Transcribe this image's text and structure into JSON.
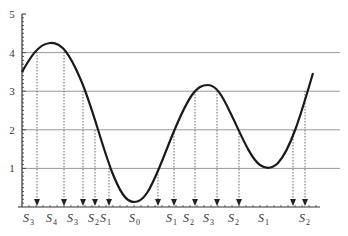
{
  "diagram": {
    "type": "curve-quantization",
    "y_axis": {
      "min": 0,
      "max": 5,
      "tick_labels": [
        "1",
        "2",
        "3",
        "4",
        "5"
      ],
      "gridlines_at": [
        1,
        2,
        3,
        4
      ]
    },
    "x_axis_labels": [
      {
        "base": "S",
        "sub": "3"
      },
      {
        "base": "S",
        "sub": "4"
      },
      {
        "base": "S",
        "sub": "3"
      },
      {
        "base": "S",
        "sub": "2"
      },
      {
        "base": "S",
        "sub": "1"
      },
      {
        "base": "S",
        "sub": "0"
      },
      {
        "base": "S",
        "sub": "1"
      },
      {
        "base": "S",
        "sub": "2"
      },
      {
        "base": "S",
        "sub": "3"
      },
      {
        "base": "S",
        "sub": "2"
      },
      {
        "base": "S",
        "sub": "1"
      },
      {
        "base": "S",
        "sub": "2"
      }
    ],
    "crossing_arrows_count": 12,
    "colors": {
      "curve": "#1a1a1a",
      "axis": "#333333",
      "gridline": "#8c8c8c",
      "arrow": "#555555"
    }
  }
}
